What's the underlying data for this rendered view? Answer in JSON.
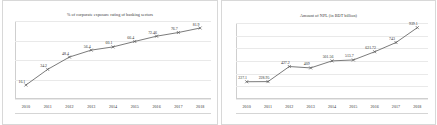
{
  "chart_data": [
    {
      "id": "corporate-exposure-rating",
      "type": "line",
      "title": "% of corporate exposure rating of banking sectors",
      "xlabel": "",
      "ylabel": "",
      "categories": [
        "2010",
        "2011",
        "2012",
        "2013",
        "2014",
        "2015",
        "2016",
        "2017",
        "2018"
      ],
      "values": [
        16.1,
        34.2,
        48.4,
        56.4,
        60.1,
        66.4,
        72.46,
        76.7,
        81.9
      ],
      "labels": [
        "16.1",
        "34.2",
        "48.4",
        "56.4",
        "60.1",
        "66.4",
        "72.46",
        "76.7",
        "81.9"
      ],
      "ylim": [
        0,
        90
      ],
      "grid": true,
      "legend": "none",
      "marker": "x",
      "line_color": "#595959",
      "label_color": "#2e2e2e",
      "grid_color": "#e9e9e9"
    },
    {
      "id": "amount-of-npl",
      "type": "line",
      "title": "Amount of NPL (in BDT billion)",
      "xlabel": "",
      "ylabel": "",
      "categories": [
        "2010",
        "2011",
        "2012",
        "2013",
        "2014",
        "2015",
        "2016",
        "2017",
        "2018"
      ],
      "values": [
        227.1,
        228.95,
        427.2,
        409,
        501.56,
        513.7,
        621.72,
        743,
        939.1
      ],
      "labels": [
        "227.1",
        "228.95",
        "427.2",
        "409",
        "501.56",
        "513.7",
        "621.72",
        "743",
        "939.1"
      ],
      "ylim": [
        0,
        1000
      ],
      "grid": true,
      "legend": "none",
      "marker": "x",
      "line_color": "#595959",
      "label_color": "#2e2e2e",
      "grid_color": "#e9e9e9"
    }
  ]
}
